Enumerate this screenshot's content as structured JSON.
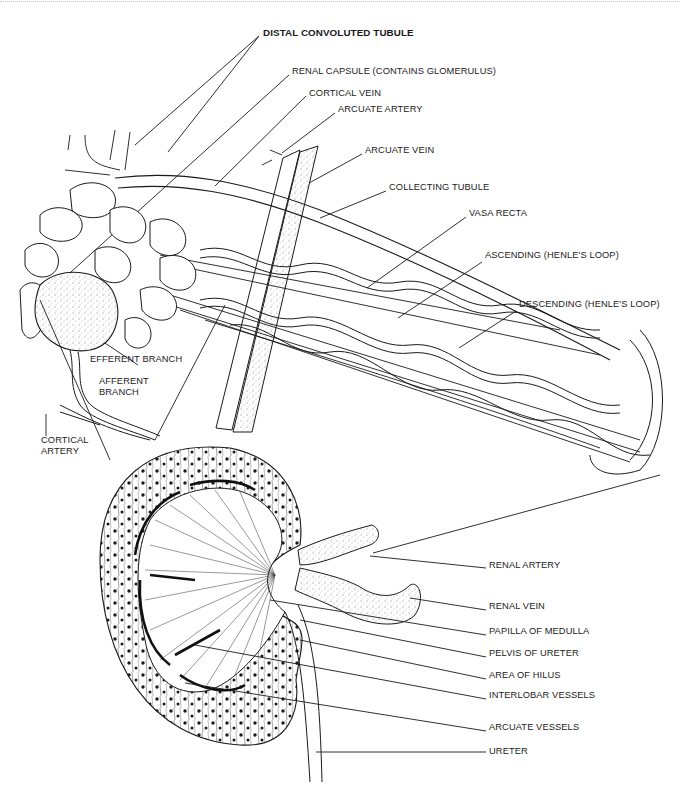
{
  "figure": {
    "colors": {
      "ink": "#1a1a1a",
      "background": "#ffffff",
      "stipple": "#555555"
    }
  },
  "labels": {
    "distal_convoluted_tubule": "DISTAL CONVOLUTED TUBULE",
    "renal_capsule": "RENAL CAPSULE (CONTAINS GLOMERULUS)",
    "cortical_vein": "CORTICAL VEIN",
    "arcuate_artery": "ARCUATE ARTERY",
    "arcuate_vein": "ARCUATE VEIN",
    "collecting_tubule": "COLLECTING TUBULE",
    "vasa_recta": "VASA RECTA",
    "ascending_henle": "ASCENDING (HENLE'S LOOP)",
    "descending_henle": "DESCENDING (HENLE'S LOOP)",
    "efferent_branch": "EFFERENT BRANCH",
    "afferent_branch": "AFFERENT\nBRANCH",
    "cortical_artery": "CORTICAL\nARTERY",
    "renal_artery": "RENAL ARTERY",
    "renal_vein": "RENAL VEIN",
    "papilla_of_medulla": "PAPILLA OF MEDULLA",
    "pelvis_of_ureter": "PELVIS OF URETER",
    "area_of_hilus": "AREA OF HILUS",
    "interlobar_vessels": "INTERLOBAR VESSELS",
    "arcuate_vessels": "ARCUATE VESSELS",
    "ureter": "URETER"
  }
}
